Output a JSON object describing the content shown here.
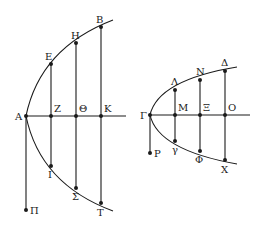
{
  "figures": [
    {
      "name": "left-parabola",
      "vertex": {
        "label": "Α",
        "x": 26,
        "y": 116
      },
      "axis_end": {
        "x": 126,
        "y": 116
      },
      "curve_upper_end": {
        "x": 113,
        "y": 20
      },
      "curve_lower_end": {
        "x": 113,
        "y": 211
      },
      "tail": {
        "label": "Π",
        "x": 26,
        "y": 210
      },
      "ordinates": [
        {
          "foot": {
            "label": "Ζ",
            "x": 51,
            "y": 116
          },
          "top": {
            "label": "Ε",
            "x": 51,
            "y": 64
          },
          "bottom": {
            "label": "Ι",
            "x": 51,
            "y": 166
          }
        },
        {
          "foot": {
            "label": "Θ",
            "x": 76,
            "y": 116
          },
          "top": {
            "label": "Η",
            "x": 76,
            "y": 43
          },
          "bottom": {
            "label": "Σ",
            "x": 76,
            "y": 188
          }
        },
        {
          "foot": {
            "label": "Κ",
            "x": 101,
            "y": 116
          },
          "top": {
            "label": "Β",
            "x": 101,
            "y": 27
          },
          "bottom": {
            "label": "Τ",
            "x": 101,
            "y": 203
          }
        }
      ]
    },
    {
      "name": "right-parabola",
      "vertex": {
        "label": "Γ",
        "x": 150,
        "y": 115
      },
      "axis_end": {
        "x": 250,
        "y": 115
      },
      "curve_upper_end": {
        "x": 237,
        "y": 67
      },
      "curve_lower_end": {
        "x": 237,
        "y": 164
      },
      "tail": {
        "label": "Ρ",
        "x": 150,
        "y": 153
      },
      "ordinates": [
        {
          "foot": {
            "label": "Μ",
            "x": 175,
            "y": 115
          },
          "top": {
            "label": "Λ",
            "x": 175,
            "y": 90
          },
          "bottom": {
            "label": "γ",
            "x": 175,
            "y": 141
          }
        },
        {
          "foot": {
            "label": "Ξ",
            "x": 200,
            "y": 115
          },
          "top": {
            "label": "Ν",
            "x": 200,
            "y": 80
          },
          "bottom": {
            "label": "Φ",
            "x": 200,
            "y": 151
          }
        },
        {
          "foot": {
            "label": "Ο",
            "x": 225,
            "y": 115
          },
          "top": {
            "label": "Δ",
            "x": 225,
            "y": 71
          },
          "bottom": {
            "label": "Χ",
            "x": 225,
            "y": 160
          }
        }
      ]
    }
  ],
  "labels": {
    "A": "Α",
    "Z": "Ζ",
    "Theta": "Θ",
    "K": "Κ",
    "E": "Ε",
    "H": "Η",
    "B": "Β",
    "I": "Ι",
    "Sigma": "Σ",
    "T": "Τ",
    "Pi": "Π",
    "Gamma": "Γ",
    "M": "Μ",
    "Xi": "Ξ",
    "O": "Ο",
    "Lambda": "Λ",
    "N": "Ν",
    "Delta": "Δ",
    "gamma": "γ",
    "Phi": "Φ",
    "X": "Χ",
    "Rho": "Ρ"
  },
  "colors": {
    "ink": "#1a1a1a",
    "background": "#ffffff"
  }
}
